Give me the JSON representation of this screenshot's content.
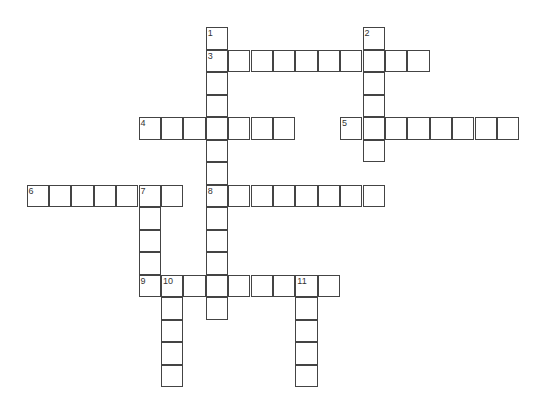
{
  "crossword": {
    "origin": {
      "x": 26.5,
      "y": 27
    },
    "cell_size": {
      "w": 22.4,
      "h": 22.5
    },
    "colors": {
      "border": "#444444",
      "background": "#ffffff",
      "number": "#333333"
    },
    "words": [
      {
        "number": "1",
        "direction": "down",
        "row": 0,
        "col": 8,
        "length": 13
      },
      {
        "number": "2",
        "direction": "down",
        "row": 0,
        "col": 15,
        "length": 6
      },
      {
        "number": "3",
        "direction": "across",
        "row": 1,
        "col": 8,
        "length": 10
      },
      {
        "number": "4",
        "direction": "across",
        "row": 4,
        "col": 5,
        "length": 7
      },
      {
        "number": "5",
        "direction": "across",
        "row": 4,
        "col": 14,
        "length": 8
      },
      {
        "number": "6",
        "direction": "across",
        "row": 7,
        "col": 0,
        "length": 7
      },
      {
        "number": "7",
        "direction": "down",
        "row": 7,
        "col": 5,
        "length": 5
      },
      {
        "number": "8",
        "direction": "across",
        "row": 7,
        "col": 8,
        "length": 8
      },
      {
        "number": "9",
        "direction": "across",
        "row": 11,
        "col": 5,
        "length": 9
      },
      {
        "number": "10",
        "direction": "down",
        "row": 11,
        "col": 6,
        "length": 5
      },
      {
        "number": "11",
        "direction": "down",
        "row": 11,
        "col": 12,
        "length": 5
      }
    ]
  }
}
